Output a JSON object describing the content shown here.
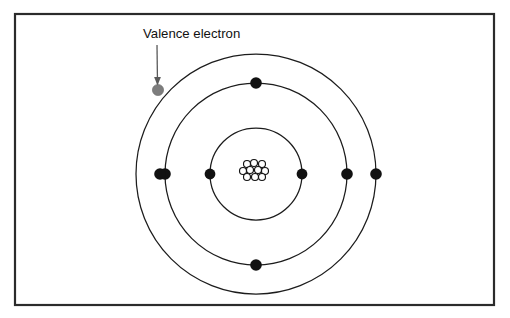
{
  "figure": {
    "background_color": "#ffffff",
    "frame": {
      "stroke_color": "#2b2b2b",
      "x": 15,
      "y": 14,
      "width": 479,
      "height": 291
    }
  },
  "annotations": [
    {
      "id": "valence-electron-label",
      "text": "Valence electron",
      "text_x": 143,
      "text_y": 35,
      "pointer": {
        "from_x": 157,
        "from_y": 45,
        "to_x": 157.5,
        "to_y": 84,
        "color": "#5a5a5a"
      }
    }
  ],
  "atom": {
    "center_x": 256,
    "center_y": 174,
    "nucleus": {
      "label": "nucleus",
      "nucleon_radius": 3.5,
      "nucleon_fill": "#ffffff",
      "nucleon_stroke": "#131313",
      "nucleons": [
        {
          "x": 247,
          "y": 164
        },
        {
          "x": 254,
          "y": 163
        },
        {
          "x": 262,
          "y": 164
        },
        {
          "x": 243,
          "y": 171
        },
        {
          "x": 250,
          "y": 170
        },
        {
          "x": 258,
          "y": 170
        },
        {
          "x": 265,
          "y": 171
        },
        {
          "x": 247,
          "y": 177
        },
        {
          "x": 255,
          "y": 177
        },
        {
          "x": 262,
          "y": 177
        }
      ]
    },
    "shells": [
      {
        "name": "inner-shell",
        "index": 1,
        "radius": 46,
        "stroke_color": "#1c1c1c",
        "electron_count": 2,
        "electrons": [
          {
            "name": "electron-inner-left",
            "x": 210,
            "y": 174,
            "radius": 5.4,
            "color": "#111111",
            "type": "core"
          },
          {
            "name": "electron-inner-right",
            "x": 302,
            "y": 174,
            "radius": 5.4,
            "color": "#111111",
            "type": "core"
          }
        ]
      },
      {
        "name": "middle-shell",
        "index": 2,
        "radius": 91,
        "stroke_color": "#1c1c1c",
        "electron_count": 4,
        "electrons": [
          {
            "name": "electron-middle-left",
            "x": 165,
            "y": 174,
            "radius": 5.8,
            "color": "#111111",
            "type": "core"
          },
          {
            "name": "electron-middle-top",
            "x": 256,
            "y": 83,
            "radius": 5.8,
            "color": "#111111",
            "type": "core"
          },
          {
            "name": "electron-middle-right",
            "x": 347,
            "y": 174,
            "radius": 5.8,
            "color": "#111111",
            "type": "core"
          },
          {
            "name": "electron-middle-bottom",
            "x": 256,
            "y": 265,
            "radius": 5.8,
            "color": "#111111",
            "type": "core"
          }
        ]
      },
      {
        "name": "outer-shell",
        "index": 3,
        "radius": 120,
        "stroke_color": "#1c1c1c",
        "electron_count": 3,
        "electrons": [
          {
            "name": "electron-outer-left",
            "x": 160,
            "y": 174,
            "radius": 5.8,
            "color": "#111111",
            "type": "core"
          },
          {
            "name": "electron-outer-right",
            "x": 376,
            "y": 174,
            "radius": 5.8,
            "color": "#111111",
            "type": "core"
          },
          {
            "name": "valence-electron",
            "x": 158,
            "y": 90,
            "radius": 5.6,
            "color": "#7d7d7d",
            "type": "valence"
          }
        ]
      }
    ]
  }
}
